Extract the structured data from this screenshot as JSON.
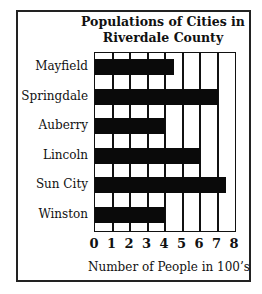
{
  "chart_data": {
    "type": "bar",
    "orientation": "horizontal",
    "title": "Populations of Cities in Riverdale County",
    "title_lines": [
      "Populations of Cities in",
      "Riverdale County"
    ],
    "categories": [
      "Mayfield",
      "Springdale",
      "Auberry",
      "Lincoln",
      "Sun City",
      "Winston"
    ],
    "values": [
      4.5,
      7,
      4,
      6,
      7.5,
      4
    ],
    "xlabel": "Number of People in 100’s",
    "ylabel": "",
    "xlim": [
      0,
      8
    ],
    "xticks": [
      "0",
      "1",
      "2",
      "3",
      "4",
      "5",
      "6",
      "7",
      "8"
    ],
    "grid": true,
    "legend": null,
    "colors": {
      "bar": "#0a0a0a",
      "grid": "#111111",
      "background": "#ffffff"
    }
  }
}
